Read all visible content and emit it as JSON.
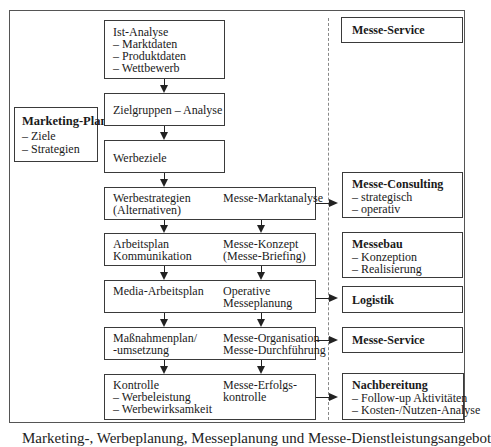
{
  "diagram": {
    "marketing_plan": {
      "title": "Marketing-Plan",
      "items": [
        "– Ziele",
        "– Strategien"
      ]
    },
    "left_flow": [
      {
        "id": "ist-analyse",
        "lines": [
          "Ist-Analyse",
          "– Marktdaten",
          "– Produktdaten",
          "– Wettbewerb"
        ]
      },
      {
        "id": "zielgruppen",
        "lines": [
          "Zielgruppen – Analyse"
        ]
      },
      {
        "id": "werbeziele",
        "lines": [
          "Werbeziele"
        ]
      },
      {
        "id": "werbestrategien",
        "left": [
          "Werbestrategien",
          "(Alternativen)"
        ],
        "right": [
          "Messe-Marktanalyse"
        ]
      },
      {
        "id": "arbeitsplan",
        "left": [
          "Arbeitsplan",
          "Kommunikation"
        ],
        "right": [
          "Messe-Konzept",
          "(Messe-Briefing)"
        ]
      },
      {
        "id": "media",
        "left": [
          "Media-Arbeitsplan"
        ],
        "right": [
          "Operative",
          "Messeplanung"
        ]
      },
      {
        "id": "massnahmen",
        "left": [
          "Maßnahmenplan/",
          "-umsetzung"
        ],
        "right": [
          "Messe-Organisation",
          "Messe-Durchführung"
        ]
      },
      {
        "id": "kontrolle",
        "left": [
          "Kontrolle",
          "– Werbeleistung",
          "– Werbewirksamkeit"
        ],
        "right": [
          "Messe-Erfolgs-",
          "kontrolle"
        ]
      }
    ],
    "services": [
      {
        "id": "messe-service-top",
        "title": "Messe-Service",
        "items": []
      },
      {
        "id": "messe-consulting",
        "title": "Messe-Consulting",
        "items": [
          "– strategisch",
          "– operativ"
        ]
      },
      {
        "id": "messebau",
        "title": "Messebau",
        "items": [
          "– Konzeption",
          "– Realisierung"
        ]
      },
      {
        "id": "logistik",
        "title": "Logistik",
        "items": []
      },
      {
        "id": "messe-service",
        "title": "Messe-Service",
        "items": []
      },
      {
        "id": "nachbereitung",
        "title": "Nachbereitung",
        "items": [
          "– Follow-up Aktivitäten",
          "– Kosten-/Nutzen-Analyse"
        ]
      }
    ],
    "caption": "Marketing-, Werbeplanung, Messeplanung und Messe-Dienstleistungsangebot"
  }
}
